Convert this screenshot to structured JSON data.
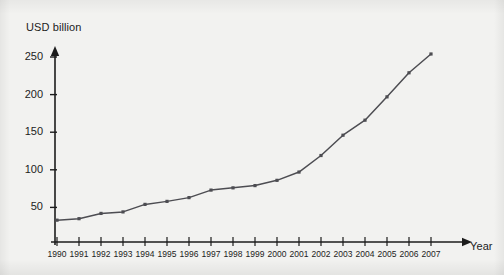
{
  "chart_data": {
    "type": "line",
    "title": "",
    "subtitle": "",
    "xlabel": "Year",
    "ylabel": "USD billion",
    "grid": false,
    "legend": false,
    "legend_position": "none",
    "xlim": [
      1990,
      2007
    ],
    "ylim": [
      0,
      265
    ],
    "ytick_labels": [
      "50",
      "100",
      "150",
      "200",
      "250"
    ],
    "ytick_values": [
      50,
      100,
      150,
      200,
      250
    ],
    "categories": [
      "1990",
      "1991",
      "1992",
      "1993",
      "1994",
      "1995",
      "1996",
      "1997",
      "1998",
      "1999",
      "2000",
      "2001",
      "2002",
      "2003",
      "2004",
      "2005",
      "2006",
      "2007"
    ],
    "x": [
      1990,
      1991,
      1992,
      1993,
      1994,
      1995,
      1996,
      1997,
      1998,
      1999,
      2000,
      2001,
      2002,
      2003,
      2004,
      2005,
      2006,
      2007
    ],
    "values": [
      33,
      35,
      42,
      44,
      54,
      58,
      63,
      73,
      76,
      79,
      86,
      97,
      119,
      146,
      166,
      197,
      229,
      254
    ],
    "series": [
      {
        "name": "USD billion",
        "values": [
          33,
          35,
          42,
          44,
          54,
          58,
          63,
          73,
          76,
          79,
          86,
          97,
          119,
          146,
          166,
          197,
          229,
          254
        ]
      }
    ],
    "marker": "square",
    "line_color": "#4d4d52",
    "axis_color": "#1c1c1c",
    "background_color": "#f2f2f0",
    "annotations": []
  },
  "axes": {
    "y_axis_title": "USD billion",
    "x_axis_title": "Year"
  }
}
